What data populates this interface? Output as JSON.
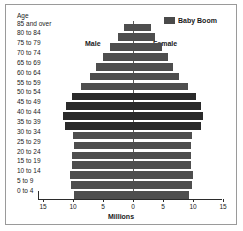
{
  "axis": {
    "age_title": "Age",
    "x_title": "Millions",
    "x_ticks": [
      "15",
      "10",
      "5",
      "0",
      "5",
      "10",
      "15"
    ]
  },
  "annotations": {
    "male": "Male",
    "female": "Female"
  },
  "legend": {
    "label": "Baby Boom",
    "swatch_color": "#4a4a4a"
  },
  "colors": {
    "baby_boom_bar": "#2a2a2a",
    "normal_bar": "#4e4e4e",
    "axis": "#2b2b2b",
    "frame": "#9a9a9a",
    "background": "#ffffff"
  },
  "chart_data": {
    "type": "bar",
    "title": "",
    "subtitle": "",
    "xlabel": "Millions",
    "ylabel": "Age",
    "orientation": "horizontal",
    "layout": "population-pyramid",
    "grid": false,
    "legend_position": "top-right",
    "xlim": [
      -15,
      15
    ],
    "xticks": [
      -15,
      -10,
      -5,
      0,
      5,
      10,
      15
    ],
    "xtick_labels": [
      "15",
      "10",
      "5",
      "0",
      "5",
      "10",
      "15"
    ],
    "categories": [
      "0 to 4",
      "5 to 9",
      "10 to 14",
      "15 to 19",
      "20 to 24",
      "25 to 29",
      "30 to 34",
      "35 to 39",
      "40 to 44",
      "45 to 49",
      "50 to 54",
      "55 to 59",
      "60 to 64",
      "65 to 69",
      "70 to 74",
      "75 to 79",
      "80 to 84",
      "85 and over"
    ],
    "baby_boom_categories": [
      "35 to 39",
      "40 to 44",
      "45 to 49",
      "50 to 54"
    ],
    "series": [
      {
        "name": "Male",
        "side": "left",
        "values": [
          9.8,
          10.3,
          10.5,
          10.2,
          10.1,
          9.9,
          10.0,
          11.4,
          11.6,
          11.1,
          10.2,
          8.7,
          7.2,
          6.1,
          5.0,
          3.9,
          2.5,
          1.5
        ]
      },
      {
        "name": "Female",
        "side": "right",
        "values": [
          9.4,
          9.9,
          10.0,
          9.7,
          9.7,
          9.7,
          9.9,
          11.4,
          11.7,
          11.3,
          10.5,
          9.1,
          7.7,
          6.7,
          5.8,
          4.9,
          3.6,
          3.0
        ]
      }
    ]
  }
}
